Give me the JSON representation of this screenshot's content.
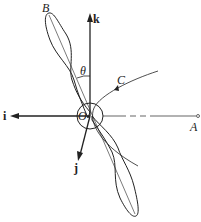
{
  "diagram": {
    "type": "propeller-rotation-axes",
    "labels": {
      "blade_tip": "B",
      "curve": "C",
      "angle": "θ",
      "origin": "O",
      "point": "A",
      "axis_i": "i",
      "axis_j": "j",
      "axis_k": "k"
    },
    "colors": {
      "line": "#222222",
      "background": "#ffffff"
    }
  }
}
